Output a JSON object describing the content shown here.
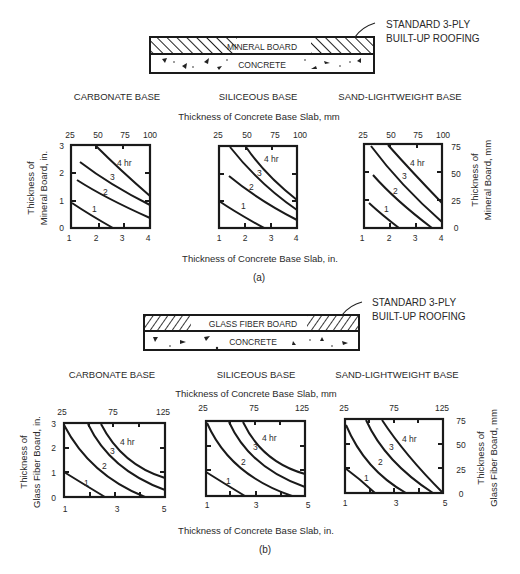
{
  "figure": {
    "part_a": {
      "caption": "(a)",
      "section_diagram": {
        "top_layer_label": "MINERAL BOARD",
        "bottom_layer_label": "CONCRETE",
        "callout_line1": "STANDARD 3-PLY",
        "callout_line2": "BUILT-UP ROOFING"
      },
      "top_axis_title": "Thickness of Concrete Base Slab, mm",
      "bottom_axis_title": "Thickness of Concrete Base Slab, in.",
      "left_axis_title_line1": "Thickness of",
      "left_axis_title_line2": "Mineral Board, in.",
      "right_axis_title_line1": "Thickness of",
      "right_axis_title_line2": "Mineral Board, mm",
      "panels": [
        {
          "title": "CARBONATE BASE"
        },
        {
          "title": "SILICEOUS BASE"
        },
        {
          "title": "SAND-LIGHTWEIGHT BASE"
        }
      ],
      "x_ticks_in": [
        "1",
        "2",
        "3",
        "4"
      ],
      "x_ticks_mm": [
        "25",
        "50",
        "75",
        "100"
      ],
      "y_ticks_in": [
        "0",
        "1",
        "2",
        "3"
      ],
      "y_ticks_mm": [
        "0",
        "25",
        "50",
        "75"
      ],
      "curve_labels": [
        "1",
        "2",
        "3",
        "4 hr"
      ]
    },
    "part_b": {
      "caption": "(b)",
      "section_diagram": {
        "top_layer_label": "GLASS FIBER BOARD",
        "bottom_layer_label": "CONCRETE",
        "callout_line1": "STANDARD 3-PLY",
        "callout_line2": "BUILT-UP ROOFING"
      },
      "top_axis_title": "Thickness of Concrete Base Slab, mm",
      "bottom_axis_title": "Thickness of Concrete Base Slab, in.",
      "left_axis_title_line1": "Thickness of",
      "left_axis_title_line2": "Glass Fiber Board, in.",
      "right_axis_title_line1": "Thickness of",
      "right_axis_title_line2": "Glass Fiber Board, mm",
      "panels": [
        {
          "title": "CARBONATE BASE"
        },
        {
          "title": "SILICEOUS BASE"
        },
        {
          "title": "SAND-LIGHTWEIGHT BASE"
        }
      ],
      "x_ticks_in": [
        "1",
        "3",
        "5"
      ],
      "x_ticks_mm": [
        "25",
        "75",
        "125"
      ],
      "y_ticks_in": [
        "0",
        "1",
        "2",
        "3"
      ],
      "y_ticks_mm": [
        "0",
        "25",
        "50",
        "75"
      ],
      "curve_labels": [
        "1",
        "2",
        "3",
        "4 hr"
      ]
    }
  }
}
